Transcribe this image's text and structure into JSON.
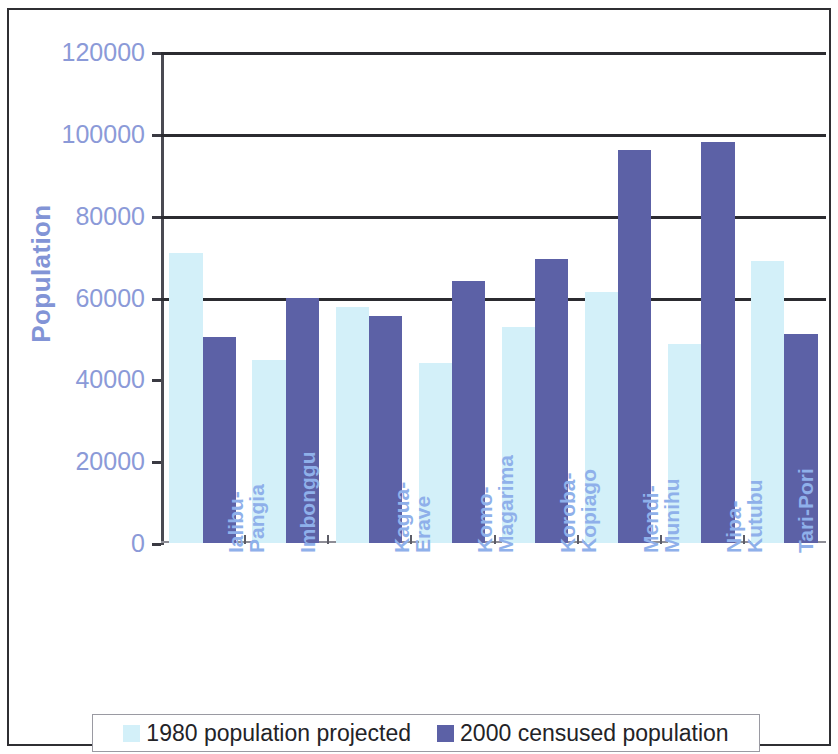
{
  "chart_data": {
    "type": "bar",
    "title": "",
    "subtitle": "",
    "xlabel": "",
    "ylabel": "Population",
    "ylim": [
      0,
      120000
    ],
    "ytick_labels": [
      "120000",
      "100000",
      "80000",
      "60000",
      "40000",
      "20000",
      "0"
    ],
    "yticks": [
      120000,
      100000,
      80000,
      60000,
      40000,
      20000,
      0
    ],
    "grid": true,
    "gridlines_drawn": [
      120000,
      100000,
      80000,
      60000
    ],
    "legend_position": "bottom",
    "categories": [
      "Ialibu-Pangia",
      "Imbonggu",
      "Kagua-Erave",
      "Komo-Magarima",
      "Koroba-Kopiago",
      "Mendi-Munihu",
      "Nipa-Kutubu",
      "Tari-Pori"
    ],
    "category_lines": [
      [
        "Ialibu-",
        "Pangia"
      ],
      [
        "Imbonggu"
      ],
      [
        "Kagua-",
        "Erave"
      ],
      [
        "Komo-",
        "Magarima"
      ],
      [
        "Koroba-",
        "Kopiago"
      ],
      [
        "Mendi-",
        "Munihu"
      ],
      [
        "Nipa-",
        "Kutubu"
      ],
      [
        "Tari-Pori"
      ]
    ],
    "series": [
      {
        "name": "1980 population projected",
        "color": "#d3f0f9",
        "values": [
          70800,
          44700,
          57600,
          44000,
          52900,
          61400,
          48700,
          69000
        ]
      },
      {
        "name": "2000 censused population",
        "color": "#5c61a6",
        "values": [
          50400,
          60000,
          55400,
          64100,
          69300,
          96100,
          97900,
          51200
        ]
      }
    ]
  },
  "style": {
    "axis_label_color": "#8294d6",
    "tick_label_color": "#8b9ad8",
    "category_label_color": "#8fb0ea",
    "axis_line_color": "#2b2b30",
    "frame_color": "#2f2f33",
    "legend_text_color": "#232327"
  }
}
